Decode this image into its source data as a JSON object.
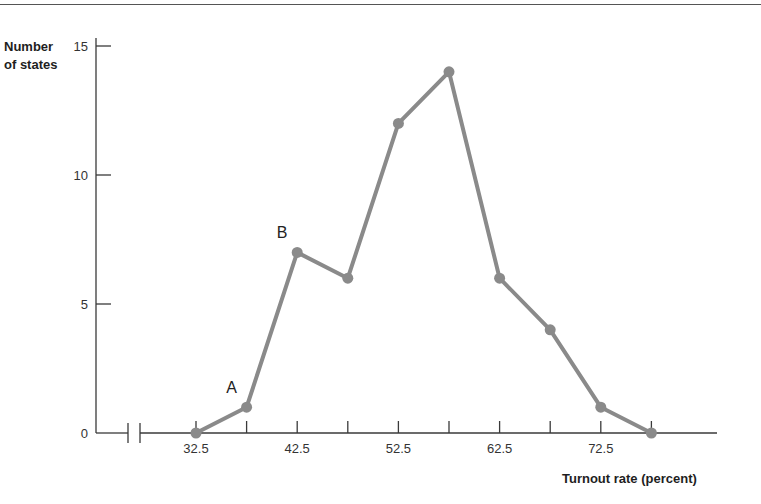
{
  "chart_data": {
    "type": "line",
    "title": "",
    "xlabel": "Turnout rate (percent)",
    "ylabel": "Number of states",
    "x": [
      32.5,
      37.5,
      42.5,
      47.5,
      52.5,
      57.5,
      62.5,
      67.5,
      72.5,
      77.5
    ],
    "values": [
      0,
      1,
      7,
      6,
      12,
      14,
      6,
      4,
      1,
      0
    ],
    "x_tick_labels": [
      "32.5",
      "42.5",
      "52.5",
      "62.5",
      "72.5"
    ],
    "y_ticks": [
      0,
      5,
      10,
      15
    ],
    "ylim": [
      0,
      15
    ],
    "axis_break": true,
    "grid": false,
    "legend": null,
    "annotations": [
      {
        "label": "A",
        "x": 37.5,
        "y": 1
      },
      {
        "label": "B",
        "x": 42.5,
        "y": 7
      }
    ],
    "line_color": "#8a8a8a"
  },
  "labels": {
    "ylabel_line1": "Number",
    "ylabel_line2": "of states",
    "xlabel": "Turnout rate (percent)"
  }
}
